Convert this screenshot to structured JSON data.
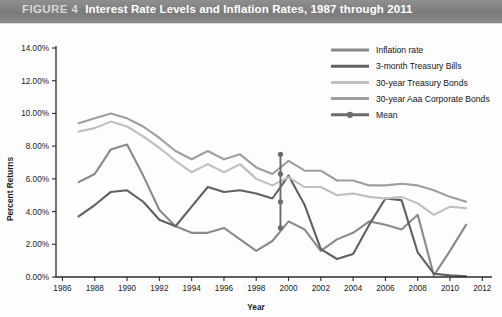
{
  "header": {
    "figure_label": "FIGURE 4",
    "title": "Interest Rate Levels and Inflation Rates, 1987 through 2011",
    "bar_color": "#7f7f7f"
  },
  "chart_data": {
    "type": "line",
    "title": "Interest Rate Levels and Inflation Rates, 1987 through 2011",
    "xlabel": "Year",
    "ylabel": "Percent Returns",
    "xlim": [
      1985.6,
      2012.6
    ],
    "ylim": [
      0,
      14
    ],
    "ytick_labels": [
      "0.00%",
      "2.00%",
      "4.00%",
      "6.00%",
      "8.00%",
      "10.00%",
      "12.00%",
      "14.00%"
    ],
    "ytick_values": [
      0,
      2,
      4,
      6,
      8,
      10,
      12,
      14
    ],
    "xtick_labels": [
      "1986",
      "1988",
      "1990",
      "1992",
      "1994",
      "1996",
      "1998",
      "2000",
      "2002",
      "2004",
      "2006",
      "2008",
      "2010",
      "2012"
    ],
    "xtick_values": [
      1986,
      1988,
      1990,
      1992,
      1994,
      1996,
      1998,
      2000,
      2002,
      2004,
      2006,
      2008,
      2010,
      2012
    ],
    "grid": false,
    "legend_position": "upper right",
    "x": [
      1987,
      1988,
      1989,
      1990,
      1991,
      1992,
      1993,
      1994,
      1995,
      1996,
      1997,
      1998,
      1999,
      2000,
      2001,
      2002,
      2003,
      2004,
      2005,
      2006,
      2007,
      2008,
      2009,
      2010,
      2011
    ],
    "series": [
      {
        "name": "Inflation rate",
        "color": "#8a8a8a",
        "width": 2.1,
        "values": [
          5.8,
          6.3,
          7.8,
          8.1,
          6.2,
          4.1,
          3.1,
          2.7,
          2.7,
          3.0,
          2.3,
          1.6,
          2.2,
          3.4,
          2.9,
          1.6,
          2.3,
          2.7,
          3.4,
          3.2,
          2.9,
          3.8,
          0.1,
          1.6,
          3.2
        ]
      },
      {
        "name": "3-month Treasury Bills",
        "color": "#606060",
        "width": 2.1,
        "values": [
          3.7,
          4.4,
          5.2,
          5.3,
          4.6,
          3.5,
          3.1,
          4.3,
          5.5,
          5.2,
          5.3,
          5.1,
          4.8,
          6.2,
          4.4,
          1.7,
          1.1,
          1.4,
          3.2,
          4.8,
          4.7,
          1.5,
          0.2,
          0.1,
          0.05
        ]
      },
      {
        "name": "30-year Treasury Bonds",
        "color": "#bfbfbf",
        "width": 2.1,
        "values": [
          8.9,
          9.1,
          9.5,
          9.2,
          8.6,
          7.9,
          7.1,
          6.4,
          6.9,
          6.4,
          6.9,
          6.0,
          5.6,
          6.1,
          5.5,
          5.5,
          5.0,
          5.1,
          4.9,
          4.8,
          4.9,
          4.5,
          3.8,
          4.3,
          4.2
        ]
      },
      {
        "name": "30-year Aaa Corporate Bonds",
        "color": "#9e9e9e",
        "width": 2.1,
        "values": [
          9.4,
          9.7,
          10.0,
          9.7,
          9.2,
          8.5,
          7.7,
          7.2,
          7.7,
          7.2,
          7.5,
          6.7,
          6.3,
          7.1,
          6.5,
          6.5,
          5.9,
          5.9,
          5.6,
          5.6,
          5.7,
          5.6,
          5.3,
          4.9,
          4.6
        ]
      }
    ],
    "mean_marker": {
      "name": "Mean",
      "color": "#6b6b6b",
      "x": 1999.5,
      "values": [
        7.5,
        6.3,
        4.6,
        3.0
      ],
      "note": "vertical line with dots marking series means"
    },
    "legend": [
      {
        "label": "Inflation rate",
        "color": "#8a8a8a",
        "marker": false
      },
      {
        "label": "3-month Treasury Bills",
        "color": "#606060",
        "marker": false
      },
      {
        "label": "30-year Treasury Bonds",
        "color": "#bfbfbf",
        "marker": false
      },
      {
        "label": "30-year Aaa Corporate Bonds",
        "color": "#9e9e9e",
        "marker": false
      },
      {
        "label": "Mean",
        "color": "#6b6b6b",
        "marker": true
      }
    ]
  }
}
